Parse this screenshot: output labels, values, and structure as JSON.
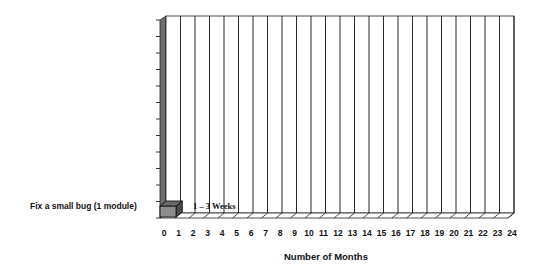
{
  "chart_data": {
    "type": "bar",
    "orientation": "horizontal",
    "style": "3d",
    "title": "",
    "categories": [
      "Fix a small bug (1 module)"
    ],
    "series": [
      {
        "name": "Duration",
        "values": [
          0.5
        ]
      }
    ],
    "xlabel": "Number of Months",
    "ylabel": "",
    "xlim": [
      0,
      24
    ],
    "x_ticks": [
      "0",
      "1",
      "2",
      "3",
      "4",
      "5",
      "6",
      "7",
      "8",
      "9",
      "10",
      "11",
      "12",
      "13",
      "14",
      "15",
      "16",
      "17",
      "18",
      "19",
      "20",
      "21",
      "22",
      "23",
      "24"
    ],
    "grid": true,
    "legend": "none",
    "annotations": [
      {
        "text": "1 – 3 Weeks",
        "near_category": "Fix a small bug (1 module)"
      }
    ],
    "colors": {
      "bar": "#8c8c8c",
      "wall": "#6e6e6e",
      "gridline": "#111111",
      "background": "#ffffff"
    }
  }
}
